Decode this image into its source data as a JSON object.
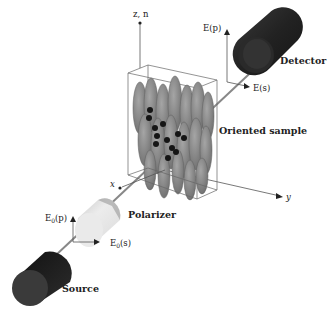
{
  "labels": {
    "z_axis": "z, n",
    "x_axis": "x",
    "y_axis": "y",
    "detector": "Detector",
    "oriented_sample": "Oriented sample",
    "polarizer": "Polarizer",
    "source": "Source",
    "E_p": "E(p)",
    "E_s": "E(s)",
    "E0_p_main": "E",
    "E0_p_sub": "0",
    "E0_p_tail": "(p)",
    "E0_s_main": "E",
    "E0_s_sub": "0",
    "E0_s_tail": "(s)"
  },
  "colors": {
    "cylinder_dark": "#1e1e1e",
    "polarizer_light": "#e4e4e4",
    "molecule_gray": "#8a8a8a",
    "dot": "#151515",
    "line": "#555555"
  }
}
